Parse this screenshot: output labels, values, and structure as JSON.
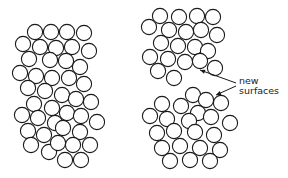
{
  "diagram": {
    "groups": [
      {
        "name": "intact-aggregate",
        "circles": [
          [
            35,
            32
          ],
          [
            51,
            32
          ],
          [
            67,
            32
          ],
          [
            84,
            33
          ],
          [
            23,
            44
          ],
          [
            40,
            47
          ],
          [
            56,
            48
          ],
          [
            72,
            47
          ],
          [
            89,
            51
          ],
          [
            29,
            59
          ],
          [
            50,
            60
          ],
          [
            66,
            61
          ],
          [
            80,
            67
          ],
          [
            20,
            73
          ],
          [
            36,
            76
          ],
          [
            52,
            78
          ],
          [
            69,
            78
          ],
          [
            84,
            84
          ],
          [
            28,
            88
          ],
          [
            45,
            91
          ],
          [
            62,
            95
          ],
          [
            76,
            99
          ],
          [
            91,
            102
          ],
          [
            34,
            104
          ],
          [
            52,
            108
          ],
          [
            67,
            113
          ],
          [
            22,
            115
          ],
          [
            38,
            118
          ],
          [
            55,
            123
          ],
          [
            81,
            116
          ],
          [
            97,
            122
          ],
          [
            28,
            131
          ],
          [
            44,
            135
          ],
          [
            63,
            128
          ],
          [
            80,
            132
          ],
          [
            31,
            145
          ],
          [
            49,
            152
          ],
          [
            58,
            143
          ],
          [
            73,
            145
          ],
          [
            90,
            145
          ],
          [
            65,
            160
          ],
          [
            81,
            160
          ]
        ]
      },
      {
        "name": "fractured-upper",
        "circles": [
          [
            160,
            16
          ],
          [
            179,
            17
          ],
          [
            197,
            16
          ],
          [
            213,
            17
          ],
          [
            149,
            27
          ],
          [
            169,
            30
          ],
          [
            186,
            32
          ],
          [
            201,
            30
          ],
          [
            217,
            35
          ],
          [
            161,
            43
          ],
          [
            178,
            46
          ],
          [
            195,
            47
          ],
          [
            208,
            51
          ],
          [
            150,
            57
          ],
          [
            168,
            59
          ],
          [
            185,
            62
          ],
          [
            200,
            61
          ],
          [
            215,
            68
          ],
          [
            158,
            71
          ],
          [
            174,
            78
          ]
        ]
      },
      {
        "name": "fractured-lower",
        "circles": [
          [
            193,
            95
          ],
          [
            206,
            100
          ],
          [
            221,
            103
          ],
          [
            162,
            104
          ],
          [
            181,
            106
          ],
          [
            198,
            113
          ],
          [
            150,
            116
          ],
          [
            167,
            119
          ],
          [
            189,
            121
          ],
          [
            211,
            117
          ],
          [
            230,
            123
          ],
          [
            157,
            133
          ],
          [
            174,
            131
          ],
          [
            195,
            132
          ],
          [
            214,
            135
          ],
          [
            162,
            148
          ],
          [
            180,
            146
          ],
          [
            200,
            148
          ],
          [
            220,
            150
          ],
          [
            170,
            161
          ],
          [
            190,
            160
          ],
          [
            210,
            161
          ]
        ]
      }
    ],
    "label": {
      "line1": "new",
      "line2": "surfaces"
    },
    "arrows": [
      {
        "name": "arrow-to-upper-surface",
        "from": [
          236,
          83
        ],
        "to": [
          200,
          70
        ]
      },
      {
        "name": "arrow-to-lower-surface",
        "from": [
          236,
          86
        ],
        "to": [
          216,
          95
        ]
      }
    ],
    "colors": {
      "stroke": "#1a1a1a",
      "background": "#ffffff"
    }
  }
}
